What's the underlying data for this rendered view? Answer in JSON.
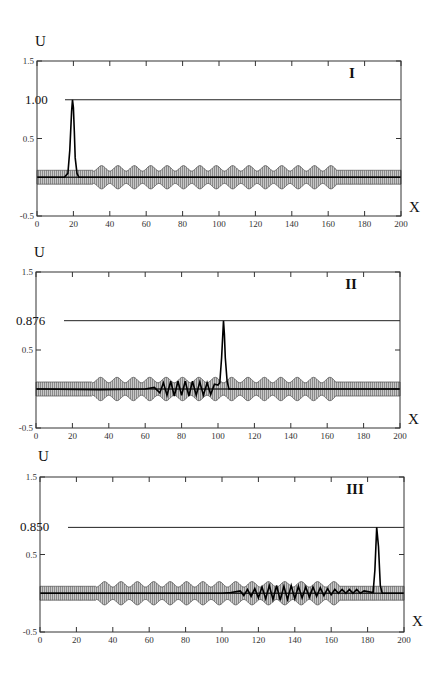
{
  "figure": {
    "panels": [
      {
        "label": "I",
        "peak_label": "1.00",
        "y_axis_name": "U",
        "x_axis_name": "X"
      },
      {
        "label": "II",
        "peak_label": "0.876",
        "y_axis_name": "U",
        "x_axis_name": "X"
      },
      {
        "label": "III",
        "peak_label": "0.850",
        "y_axis_name": "U",
        "x_axis_name": "X"
      }
    ],
    "x_ticks": [
      "0",
      "20",
      "40",
      "60",
      "80",
      "100",
      "120",
      "140",
      "160",
      "180",
      "200"
    ],
    "y_ticks": [
      "1.5",
      "0.5",
      "-0.5"
    ]
  },
  "chart_data": [
    {
      "type": "line",
      "title": "I",
      "xlabel": "X",
      "ylabel": "U",
      "xlim": [
        0,
        200
      ],
      "ylim": [
        -0.5,
        1.5
      ],
      "x_ticks": [
        0,
        20,
        40,
        60,
        80,
        100,
        120,
        140,
        160,
        180,
        200
      ],
      "y_ticks": [
        -0.5,
        0.5,
        1.5
      ],
      "grid": false,
      "annotations": [
        {
          "text": "1.00",
          "y": 1.0,
          "type": "horizontal_line"
        },
        {
          "text": "I",
          "position": "top-right"
        }
      ],
      "series": [
        {
          "name": "U(X) soliton",
          "x": [
            0,
            15,
            17,
            18,
            19,
            19.5,
            20,
            20.5,
            21,
            22,
            23,
            25,
            200
          ],
          "values": [
            0,
            0,
            0.05,
            0.35,
            0.85,
            1.0,
            0.9,
            0.6,
            0.25,
            0.05,
            0,
            0,
            0
          ]
        }
      ],
      "structure": {
        "band_halfwidth": 0.09,
        "bump_amplitude": 0.07,
        "periodic_region": [
          31,
          164
        ],
        "bump_period": 9
      }
    },
    {
      "type": "line",
      "title": "II",
      "xlabel": "X",
      "ylabel": "U",
      "xlim": [
        0,
        200
      ],
      "ylim": [
        -0.5,
        1.5
      ],
      "x_ticks": [
        0,
        20,
        40,
        60,
        80,
        100,
        120,
        140,
        160,
        180,
        200
      ],
      "y_ticks": [
        -0.5,
        0.5,
        1.5
      ],
      "grid": false,
      "annotations": [
        {
          "text": "0.876",
          "y": 0.876,
          "type": "horizontal_line"
        },
        {
          "text": "II",
          "position": "top-right"
        }
      ],
      "series": [
        {
          "name": "U(X) soliton with radiation",
          "x": [
            0,
            35,
            60,
            65,
            68,
            70,
            72,
            74,
            76,
            78,
            80,
            82,
            84,
            86,
            88,
            90,
            92,
            94,
            96,
            98,
            100,
            101,
            102,
            103,
            103.5,
            104,
            105,
            106,
            107,
            200
          ],
          "values": [
            0,
            -0.01,
            0.0,
            0.02,
            -0.05,
            0.08,
            -0.08,
            0.1,
            -0.09,
            0.1,
            -0.08,
            0.1,
            -0.09,
            0.1,
            -0.08,
            0.09,
            -0.08,
            0.08,
            -0.07,
            0.06,
            0.05,
            0.08,
            0.4,
            0.876,
            0.7,
            0.4,
            0.1,
            0.0,
            0,
            0
          ]
        }
      ],
      "structure": {
        "band_halfwidth": 0.09,
        "bump_amplitude": 0.07,
        "periodic_region": [
          31,
          164
        ],
        "bump_period": 9
      }
    },
    {
      "type": "line",
      "title": "III",
      "xlabel": "X",
      "ylabel": "U",
      "xlim": [
        0,
        200
      ],
      "ylim": [
        -0.5,
        1.5
      ],
      "x_ticks": [
        0,
        20,
        40,
        60,
        80,
        100,
        120,
        140,
        160,
        180,
        200
      ],
      "y_ticks": [
        -0.5,
        0.5,
        1.5
      ],
      "grid": false,
      "annotations": [
        {
          "text": "0.850",
          "y": 0.85,
          "type": "horizontal_line"
        },
        {
          "text": "III",
          "position": "top-right"
        }
      ],
      "series": [
        {
          "name": "U(X) soliton with radiation",
          "x": [
            0,
            100,
            105,
            110,
            112,
            114,
            116,
            118,
            120,
            122,
            124,
            126,
            128,
            130,
            132,
            134,
            136,
            138,
            140,
            142,
            144,
            146,
            148,
            150,
            152,
            154,
            156,
            158,
            160,
            162,
            164,
            166,
            168,
            170,
            172,
            174,
            176,
            178,
            183,
            184,
            185,
            186,
            187,
            188,
            200
          ],
          "values": [
            0,
            0,
            0.01,
            0.03,
            -0.03,
            0.05,
            -0.04,
            0.06,
            -0.06,
            0.08,
            -0.07,
            0.1,
            -0.08,
            0.1,
            -0.09,
            0.09,
            -0.08,
            0.1,
            -0.07,
            0.09,
            -0.06,
            0.08,
            -0.05,
            0.08,
            -0.04,
            0.07,
            -0.03,
            0.06,
            -0.02,
            0.05,
            0.0,
            0.05,
            0.0,
            0.05,
            0.0,
            0.05,
            0.0,
            0.03,
            0.01,
            0.3,
            0.85,
            0.6,
            0.1,
            0,
            0
          ]
        }
      ],
      "structure": {
        "band_halfwidth": 0.09,
        "bump_amplitude": 0.07,
        "periodic_region": [
          31,
          164
        ],
        "bump_period": 9
      }
    }
  ]
}
